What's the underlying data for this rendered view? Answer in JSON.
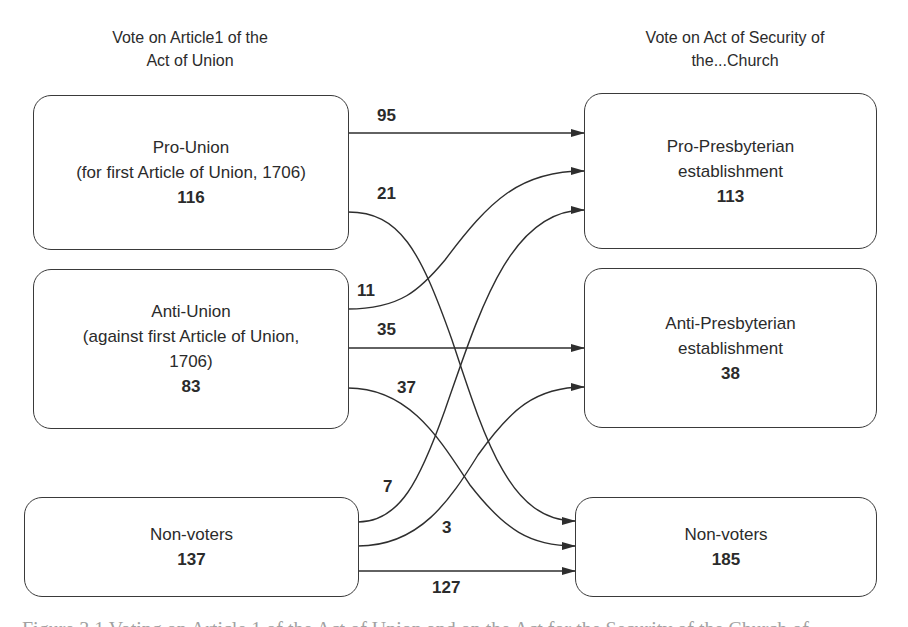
{
  "headings": {
    "left": {
      "line1": "Vote on Article1 of the",
      "line2": "Act of Union"
    },
    "right": {
      "line1": "Vote on Act of Security of",
      "line2": "the...Church"
    }
  },
  "left_nodes": [
    {
      "id": "pro_union",
      "line1": "Pro-Union",
      "line2": "(for first Article of Union, 1706)",
      "line3": "",
      "count": "116"
    },
    {
      "id": "anti_union",
      "line1": "Anti-Union",
      "line2": "(against first Article of Union,",
      "line3": "1706)",
      "count": "83"
    },
    {
      "id": "non_voters_left",
      "line1": "Non-voters",
      "line2": "",
      "line3": "",
      "count": "137"
    }
  ],
  "right_nodes": [
    {
      "id": "pro_presbyterian",
      "line1": "Pro-Presbyterian",
      "line2": "establishment",
      "count": "113"
    },
    {
      "id": "anti_presbyterian",
      "line1": "Anti-Presbyterian",
      "line2": "establishment",
      "count": "38"
    },
    {
      "id": "non_voters_right",
      "line1": "Non-voters",
      "line2": "",
      "count": "185"
    }
  ],
  "flows": [
    {
      "from": "Pro-Union",
      "to": "Pro-Presbyterian establishment",
      "value": "95"
    },
    {
      "from": "Pro-Union",
      "to": "Non-voters",
      "value": "21"
    },
    {
      "from": "Anti-Union",
      "to": "Pro-Presbyterian establishment",
      "value": "11"
    },
    {
      "from": "Anti-Union",
      "to": "Anti-Presbyterian establishment",
      "value": "35"
    },
    {
      "from": "Anti-Union",
      "to": "Non-voters",
      "value": "37"
    },
    {
      "from": "Non-voters",
      "to": "Pro-Presbyterian establishment",
      "value": "7"
    },
    {
      "from": "Non-voters",
      "to": "Anti-Presbyterian establishment",
      "value": "3"
    },
    {
      "from": "Non-voters",
      "to": "Non-voters",
      "value": "127"
    }
  ],
  "caption": "Figure 3.1  Voting on Article 1 of the Act of Union and on the Act for the Security of the Church of..."
}
